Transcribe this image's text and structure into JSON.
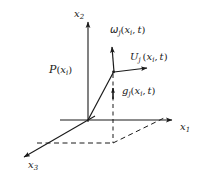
{
  "figure": {
    "background_color": "#ffffff",
    "ink_color": "#1a1a1a",
    "width": 212,
    "height": 185
  },
  "axes": [
    {
      "id": "x2",
      "name": "x-2-axis",
      "base": "x",
      "subscript": "2",
      "label_x": 74,
      "label_y": 10,
      "direction": "up",
      "from": [
        88,
        120
      ],
      "to": [
        88,
        20
      ]
    },
    {
      "id": "x1",
      "name": "x-1-axis",
      "base": "x",
      "subscript": "1",
      "label_x": 180,
      "label_y": 124,
      "direction": "right",
      "from": [
        88,
        120
      ],
      "to": [
        178,
        120
      ]
    },
    {
      "id": "x3",
      "name": "x-3-axis",
      "base": "x",
      "subscript": "3",
      "label_x": 28,
      "label_y": 163,
      "direction": "lower-left",
      "from": [
        88,
        120
      ],
      "to": [
        18,
        160
      ]
    }
  ],
  "point": {
    "name": "point-P",
    "symbol": "P",
    "base": "x",
    "subscript": "i",
    "full_label": "P(x_i)",
    "label_x": 51,
    "label_y": 66,
    "position": [
      113,
      72
    ]
  },
  "vectors": [
    {
      "id": "omega",
      "name": "omega-vector",
      "symbol": "ω",
      "symbol_subscript": "j",
      "arg_base": "x",
      "arg_subscript": "i",
      "arg_time": "t",
      "full_label": "ω_j(x_i, t)",
      "label_x": 111,
      "label_y": 27,
      "from": [
        113,
        72
      ],
      "to": [
        112,
        43
      ],
      "style": "solid"
    },
    {
      "id": "U",
      "name": "U-vector",
      "symbol": "U",
      "symbol_subscript": "j",
      "arg_base": "x",
      "arg_subscript": "i",
      "arg_time": "t",
      "full_label": "U_j (x_i, t)",
      "label_x": 131,
      "label_y": 54,
      "from": [
        113,
        72
      ],
      "to": [
        151,
        68
      ],
      "style": "solid"
    },
    {
      "id": "g",
      "name": "g-vector",
      "symbol": "g",
      "symbol_subscript": "j",
      "arg_base": "x",
      "arg_subscript": "i",
      "arg_time": "t",
      "full_label": "g_j(x_i, t)",
      "label_x": 123,
      "label_y": 88,
      "from": [
        113,
        100
      ],
      "to": [
        113,
        84
      ],
      "style": "solid"
    }
  ],
  "construction_lines": [
    {
      "name": "origin-to-point-ray",
      "style": "solid",
      "from": [
        88,
        120
      ],
      "to": [
        113,
        72
      ]
    },
    {
      "name": "vertical-drop-from-point",
      "style": "dashed",
      "from": [
        113,
        72
      ],
      "to": [
        113,
        143
      ]
    },
    {
      "name": "base-plane-horizontal-dashed",
      "style": "dashed",
      "from": [
        37,
        143
      ],
      "to": [
        113,
        143
      ]
    },
    {
      "name": "base-plane-diagonal-dashed",
      "style": "dashed",
      "from": [
        113,
        143
      ],
      "to": [
        163,
        119
      ]
    }
  ]
}
